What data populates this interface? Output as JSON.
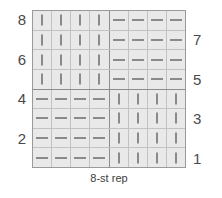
{
  "chart_data": {
    "type": "heatmap",
    "title": "",
    "subtitle": "",
    "caption": "8-st rep",
    "xlabel": "",
    "ylabel": "",
    "grid": true,
    "legend_position": "none",
    "columns": 8,
    "rows": 8,
    "symbol_legend": [
      {
        "key": "knit",
        "glyph": "|",
        "meaning": "knit"
      },
      {
        "key": "purl",
        "glyph": "—",
        "meaning": "purl"
      }
    ],
    "row_labels_left": [
      "8",
      "",
      "6",
      "",
      "4",
      "",
      "2",
      ""
    ],
    "row_labels_right": [
      "",
      "7",
      "",
      "5",
      "",
      "3",
      "",
      "1"
    ],
    "row_numbers_top_to_bottom": [
      8,
      7,
      6,
      5,
      4,
      3,
      2,
      1
    ],
    "cells": [
      [
        "knit",
        "knit",
        "knit",
        "knit",
        "purl",
        "purl",
        "purl",
        "purl"
      ],
      [
        "knit",
        "knit",
        "knit",
        "knit",
        "purl",
        "purl",
        "purl",
        "purl"
      ],
      [
        "knit",
        "knit",
        "knit",
        "knit",
        "purl",
        "purl",
        "purl",
        "purl"
      ],
      [
        "knit",
        "knit",
        "knit",
        "knit",
        "purl",
        "purl",
        "purl",
        "purl"
      ],
      [
        "purl",
        "purl",
        "purl",
        "purl",
        "knit",
        "knit",
        "knit",
        "knit"
      ],
      [
        "purl",
        "purl",
        "purl",
        "purl",
        "knit",
        "knit",
        "knit",
        "knit"
      ],
      [
        "purl",
        "purl",
        "purl",
        "purl",
        "knit",
        "knit",
        "knit",
        "knit"
      ],
      [
        "purl",
        "purl",
        "purl",
        "purl",
        "knit",
        "knit",
        "knit",
        "knit"
      ]
    ],
    "heavy_row_divider_after_index": 3,
    "heavy_column_divider_after_index": 3,
    "colors": {
      "cell_fill": "#e9e9e9",
      "grid_line": "#c2c2c2",
      "grid_border": "#9a9a9a",
      "heavy_line": "#8d8d8d",
      "symbol": "#8a8a8a",
      "label_text": "#4a4a4a",
      "caption_text": "#3d3d3d",
      "background": "#ffffff"
    }
  }
}
